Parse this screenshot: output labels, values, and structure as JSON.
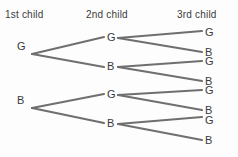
{
  "diagram": {
    "title_visible": false,
    "type": "probability-tree-diagram",
    "line_color": "#6f6f6f",
    "text_color": "#3a3a3a",
    "background_color": "#fdfdfd",
    "columns": [
      {
        "id": "col1",
        "label": "1st child"
      },
      {
        "id": "col2",
        "label": "2nd child"
      },
      {
        "id": "col3",
        "label": "3rd child"
      }
    ],
    "levels": [
      {
        "level": 1,
        "nodes": [
          {
            "id": "n-1",
            "label": "G"
          },
          {
            "id": "n-2",
            "label": "B"
          }
        ]
      },
      {
        "level": 2,
        "nodes": [
          {
            "id": "n-3",
            "label": "G"
          },
          {
            "id": "n-4",
            "label": "B"
          },
          {
            "id": "n-5",
            "label": "G"
          },
          {
            "id": "n-6",
            "label": "B"
          }
        ]
      },
      {
        "level": 3,
        "nodes": [
          {
            "id": "n-7",
            "label": "G"
          },
          {
            "id": "n-8",
            "label": "B"
          },
          {
            "id": "n-9",
            "label": "G"
          },
          {
            "id": "n-10",
            "label": "B"
          },
          {
            "id": "n-11",
            "label": "G"
          },
          {
            "id": "n-12",
            "label": "B"
          },
          {
            "id": "n-13",
            "label": "G"
          },
          {
            "id": "n-14",
            "label": "B"
          }
        ]
      }
    ],
    "edges": [
      {
        "from": "n-1",
        "to": "n-3",
        "x1": 32,
        "y1": 54,
        "x2": 104,
        "y2": 37
      },
      {
        "from": "n-1",
        "to": "n-4",
        "x1": 32,
        "y1": 54,
        "x2": 104,
        "y2": 67
      },
      {
        "from": "n-2",
        "to": "n-5",
        "x1": 32,
        "y1": 108,
        "x2": 104,
        "y2": 94
      },
      {
        "from": "n-2",
        "to": "n-6",
        "x1": 32,
        "y1": 108,
        "x2": 104,
        "y2": 123
      },
      {
        "from": "n-3",
        "to": "n-7",
        "x1": 118,
        "y1": 38,
        "x2": 202,
        "y2": 31
      },
      {
        "from": "n-3",
        "to": "n-8",
        "x1": 118,
        "y1": 38,
        "x2": 202,
        "y2": 52
      },
      {
        "from": "n-4",
        "to": "n-9",
        "x1": 118,
        "y1": 67,
        "x2": 202,
        "y2": 61
      },
      {
        "from": "n-4",
        "to": "n-10",
        "x1": 118,
        "y1": 67,
        "x2": 202,
        "y2": 81
      },
      {
        "from": "n-5",
        "to": "n-11",
        "x1": 118,
        "y1": 95,
        "x2": 202,
        "y2": 90
      },
      {
        "from": "n-5",
        "to": "n-12",
        "x1": 118,
        "y1": 95,
        "x2": 202,
        "y2": 110
      },
      {
        "from": "n-6",
        "to": "n-13",
        "x1": 118,
        "y1": 124,
        "x2": 202,
        "y2": 117
      },
      {
        "from": "n-6",
        "to": "n-14",
        "x1": 118,
        "y1": 124,
        "x2": 202,
        "y2": 140
      }
    ]
  }
}
